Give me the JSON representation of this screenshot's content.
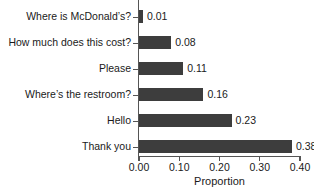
{
  "chart_data": {
    "type": "bar",
    "orientation": "horizontal",
    "title": "",
    "xlabel": "Proportion",
    "ylabel": "",
    "xlim": [
      0.0,
      0.4
    ],
    "xticks": [
      "0.00",
      "0.10",
      "0.20",
      "0.30",
      "0.40"
    ],
    "xtick_values": [
      0.0,
      0.1,
      0.2,
      0.3,
      0.4
    ],
    "grid": false,
    "legend": false,
    "bar_color": "#3d3d3d",
    "axis_color": "#555555",
    "categories": [
      "Where is McDonald’s?",
      "How much does this cost?",
      "Please",
      "Where’s the restroom?",
      "Hello",
      "Thank you"
    ],
    "values": [
      0.01,
      0.08,
      0.11,
      0.16,
      0.23,
      0.38
    ],
    "value_labels": [
      "0.01",
      "0.08",
      "0.11",
      "0.16",
      "0.23",
      "0.38"
    ]
  }
}
